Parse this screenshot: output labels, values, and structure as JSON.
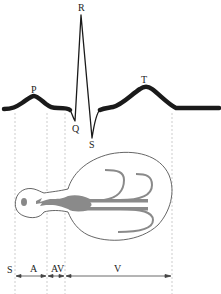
{
  "ecg": {
    "waves": {
      "p": "P",
      "q": "Q",
      "r": "R",
      "s": "S",
      "t": "T"
    }
  },
  "conduction": {
    "labels": {
      "sinus": "S",
      "atrium": "A",
      "av_node": "AV",
      "ventricle": "V"
    }
  },
  "colors": {
    "trace": "#1a1a1a",
    "heart_outline": "#555555",
    "conduction_fill": "#8a8a8a",
    "dashed_guides": "#b5b5b5"
  }
}
